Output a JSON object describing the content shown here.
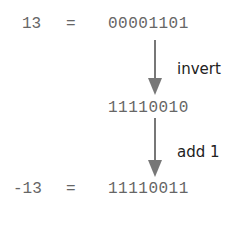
{
  "diagram": {
    "rows": [
      {
        "lhs": "13",
        "eq": "=",
        "bits": "00001101"
      },
      {
        "lhs": "",
        "eq": "",
        "bits": "11110010"
      },
      {
        "lhs": "-13",
        "eq": "=",
        "bits": "11110011"
      }
    ],
    "steps": [
      {
        "label": "invert"
      },
      {
        "label": "add 1"
      }
    ],
    "colors": {
      "text": "#666666",
      "arrow": "#777777",
      "step_label": "#222222"
    }
  }
}
